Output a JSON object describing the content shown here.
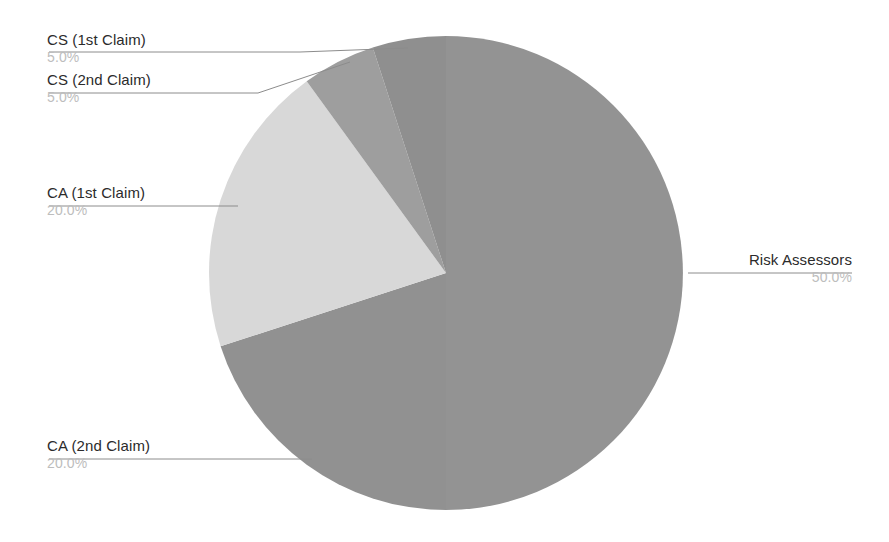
{
  "chart_data": {
    "type": "pie",
    "title": "",
    "subtitle": "",
    "xlabel": "",
    "ylabel": "",
    "legend_position": "none",
    "grid": false,
    "labels_outside": true,
    "start_angle_deg": 0,
    "direction": "clockwise",
    "categories": [
      "Risk Assessors",
      "CA (2nd Claim)",
      "CA (1st Claim)",
      "CS (2nd Claim)",
      "CS (1st Claim)"
    ],
    "values": [
      50.0,
      20.0,
      20.0,
      5.0,
      5.0
    ],
    "value_labels": [
      "50.0%",
      "20.0%",
      "20.0%",
      "5.0%",
      "5.0%"
    ],
    "slices": [
      {
        "name": "Risk Assessors",
        "percent_label": "50.0%",
        "value": 50.0,
        "color": "#939393",
        "start_angle_deg": 0,
        "end_angle_deg": 180,
        "label_side": "right"
      },
      {
        "name": "CA (2nd Claim)",
        "percent_label": "20.0%",
        "value": 20.0,
        "color": "#919191",
        "start_angle_deg": 180,
        "end_angle_deg": 252,
        "label_side": "left"
      },
      {
        "name": "CA (1st Claim)",
        "percent_label": "20.0%",
        "value": 20.0,
        "color": "#d8d8d8",
        "start_angle_deg": 252,
        "end_angle_deg": 324,
        "label_side": "left"
      },
      {
        "name": "CS (2nd Claim)",
        "percent_label": "5.0%",
        "value": 5.0,
        "color": "#9e9e9e",
        "start_angle_deg": 324,
        "end_angle_deg": 342,
        "label_side": "left"
      },
      {
        "name": "CS (1st Claim)",
        "percent_label": "5.0%",
        "value": 5.0,
        "color": "#8f8f8f",
        "start_angle_deg": 342,
        "end_angle_deg": 360,
        "label_side": "left"
      }
    ],
    "colors": {
      "slice_dark_gray": "#939393",
      "slice_light_gray": "#d8d8d8",
      "label_text": "#2b2b2b",
      "percent_text": "#bdbdbd",
      "leader_line": "#8c8c8c",
      "background": "#ffffff"
    },
    "geometry": {
      "center_x": 446,
      "center_y": 273,
      "radius": 237
    }
  }
}
